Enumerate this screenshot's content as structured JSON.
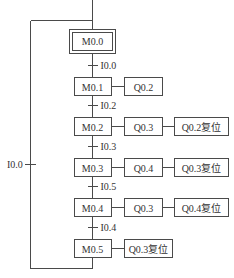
{
  "diagram": {
    "type": "sequential-function-chart",
    "initial_step": "M0.0",
    "steps": [
      {
        "name": "M0.1",
        "actions": [
          "Q0.2"
        ]
      },
      {
        "name": "M0.2",
        "actions": [
          "Q0.3",
          "Q0.2复位"
        ]
      },
      {
        "name": "M0.3",
        "actions": [
          "Q0.4",
          "Q0.3复位"
        ]
      },
      {
        "name": "M0.4",
        "actions": [
          "Q0.3",
          "Q0.4复位"
        ]
      },
      {
        "name": "M0.5",
        "actions": [
          "Q0.3复位"
        ]
      }
    ],
    "transitions": [
      "I0.0",
      "I0.2",
      "I0.3",
      "I0.5",
      "I0.4"
    ],
    "return_transition": "I0.0"
  }
}
